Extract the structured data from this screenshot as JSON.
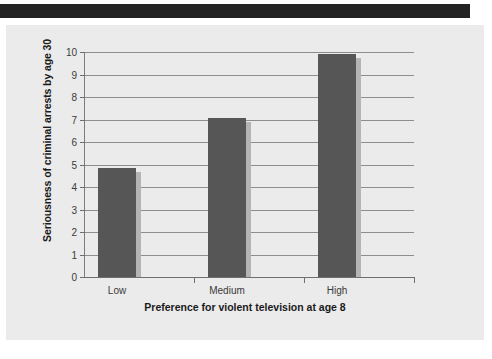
{
  "page": {
    "background_color": "#ffffff",
    "panel_color": "#ebebeb",
    "banner_color": "#232323"
  },
  "chart_data": {
    "type": "bar",
    "title": "",
    "xlabel": "Preference for violent television at age 8",
    "ylabel": "Seriousness of criminal arrests by age 30",
    "categories": [
      "Low",
      "Medium",
      "High"
    ],
    "values": [
      4.85,
      7.05,
      9.9
    ],
    "ylim": [
      0,
      10
    ],
    "ytick_labels": [
      "10",
      "9",
      "8",
      "7",
      "6",
      "5",
      "4",
      "3",
      "2",
      "1",
      "0"
    ],
    "ytick_values": [
      10,
      9,
      8,
      7,
      6,
      5,
      4,
      3,
      2,
      1,
      0
    ],
    "grid": true,
    "grid_axis": "y",
    "legend": "none",
    "bar_color": "#565656",
    "bar_shadow_color": "#b4b4b4",
    "gridline_color": "#8d8d8d",
    "axis_color": "#6f6f6f"
  }
}
